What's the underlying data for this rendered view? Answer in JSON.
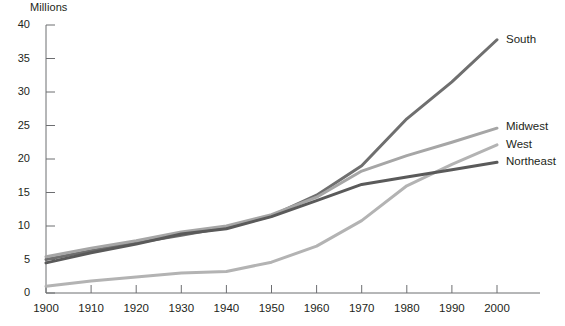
{
  "chart_data": {
    "type": "line",
    "title": "",
    "ylabel": "Millions",
    "xlabel": "",
    "x": [
      1900,
      1910,
      1920,
      1930,
      1940,
      1950,
      1960,
      1970,
      1980,
      1990,
      2000
    ],
    "xlim": [
      1900,
      2000
    ],
    "ylim": [
      0,
      40
    ],
    "grid": false,
    "legend_position": "right-inline",
    "xticks": [
      "1900",
      "1910",
      "1920",
      "1930",
      "1940",
      "1950",
      "1960",
      "1970",
      "1980",
      "1990",
      "2000"
    ],
    "yticks": [
      "0",
      "5",
      "10",
      "15",
      "20",
      "25",
      "30",
      "35",
      "40"
    ],
    "series": [
      {
        "name": "South",
        "color": "#6f6f6f",
        "values": [
          5.0,
          6.3,
          7.5,
          8.6,
          9.8,
          11.5,
          14.6,
          19.0,
          26.0,
          31.5,
          37.8
        ]
      },
      {
        "name": "Midwest",
        "color": "#a6a6a6",
        "values": [
          5.4,
          6.7,
          7.8,
          9.1,
          10.0,
          11.7,
          14.3,
          18.2,
          20.5,
          22.5,
          24.6
        ]
      },
      {
        "name": "West",
        "color": "#b3b3b3",
        "values": [
          1.0,
          1.8,
          2.4,
          3.0,
          3.2,
          4.6,
          7.0,
          10.8,
          16.0,
          19.2,
          22.1
        ]
      },
      {
        "name": "Northeast",
        "color": "#5a5a5a",
        "values": [
          4.5,
          6.0,
          7.3,
          8.8,
          9.6,
          11.4,
          13.8,
          16.2,
          17.3,
          18.4,
          19.5
        ]
      }
    ]
  },
  "axis_title": "Millions",
  "series_labels": [
    {
      "text": "South"
    },
    {
      "text": "Midwest"
    },
    {
      "text": "West"
    },
    {
      "text": "Northeast"
    }
  ]
}
